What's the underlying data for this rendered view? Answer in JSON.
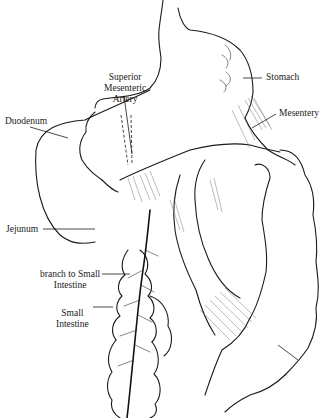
{
  "figure": {
    "colors": {
      "ink": "#1a1a1a",
      "background": "#ffffff"
    }
  },
  "labels": {
    "superior_mesenteric_artery": {
      "line1": "Superior",
      "line2": "Mesenteric",
      "line3": "Artery"
    },
    "stomach": "Stomach",
    "duodenum": "Duodenum",
    "mesentery": "Mesentery",
    "jejunum": "Jejunum",
    "branch_to_small_intestine": {
      "line1": "branch to Small",
      "line2": "Intestine"
    },
    "small_intestine": {
      "line1": "Small",
      "line2": "Intestine"
    }
  }
}
